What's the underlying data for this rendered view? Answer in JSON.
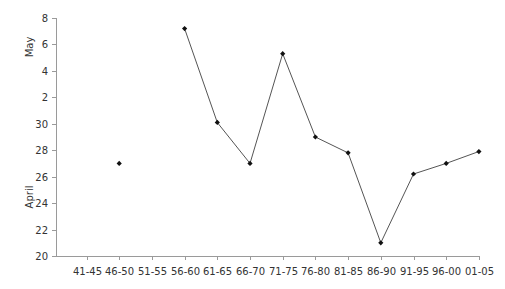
{
  "chart_data": {
    "type": "line",
    "title": "",
    "xlabel": "",
    "ylabel_upper": "May",
    "ylabel_lower": "April",
    "categories": [
      "41-45",
      "46-50",
      "51-55",
      "56-60",
      "61-65",
      "66-70",
      "71-75",
      "76-80",
      "81-85",
      "86-90",
      "91-95",
      "96-00",
      "01-05"
    ],
    "y_ticks": [
      {
        "label": "20",
        "value": 20
      },
      {
        "label": "22",
        "value": 22
      },
      {
        "label": "24",
        "value": 24
      },
      {
        "label": "26",
        "value": 26
      },
      {
        "label": "28",
        "value": 28
      },
      {
        "label": "30",
        "value": 30
      },
      {
        "label": "2",
        "value": 32
      },
      {
        "label": "4",
        "value": 34
      },
      {
        "label": "6",
        "value": 36
      },
      {
        "label": "8",
        "value": 38
      }
    ],
    "y_axis_note": "Continuous day scale: April 20 to April 30, then May 2 to May 8 (value 32 = May 2)",
    "ylim": [
      20,
      38
    ],
    "grid": false,
    "legend": null,
    "series": [
      {
        "name": "Date",
        "values": [
          null,
          27.0,
          null,
          37.2,
          30.1,
          27.0,
          35.3,
          29.0,
          27.8,
          21.0,
          26.2,
          27.0,
          27.9
        ],
        "display_dates": [
          null,
          "April 27",
          null,
          "May 7",
          "April 30",
          "April 27",
          "May 5",
          "April 29",
          "April 28",
          "April 21",
          "April 26",
          "April 27",
          "April 28"
        ],
        "color": "#555555",
        "marker_color": "#111111"
      }
    ]
  }
}
